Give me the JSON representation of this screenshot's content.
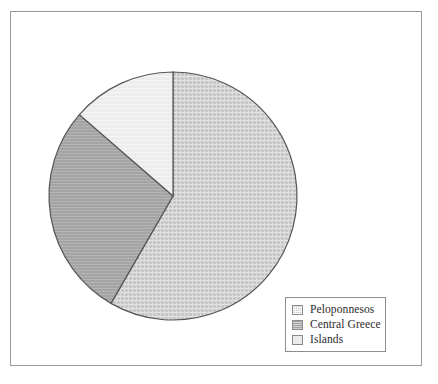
{
  "figure": {
    "background_color": "#ffffff",
    "frame_color": "#9a9a9a"
  },
  "legend": {
    "border_color": "#8d8d8d",
    "entries": [
      {
        "label": "Peloponnesos",
        "color": "#c9c9c9",
        "swatch_name": "legend-swatch-peloponnesos"
      },
      {
        "label": "Central Greece",
        "color": "#a5a5a5",
        "swatch_name": "legend-swatch-central-greece"
      },
      {
        "label": "Islands",
        "color": "#ececec",
        "swatch_name": "legend-swatch-islands"
      }
    ]
  },
  "chart_data": {
    "type": "pie",
    "title": "",
    "subtitle": "",
    "xlabel": "",
    "ylabel": "",
    "grid": false,
    "legend_position": "bottom-right",
    "center_px": [
      173,
      196
    ],
    "radius_px": 124,
    "start_angle_deg": 0,
    "direction": "clockwise",
    "outline_color": "#555555",
    "labels": [
      "Peloponnesos",
      "Central Greece",
      "Islands"
    ],
    "values": [
      58.3,
      28.1,
      13.6
    ],
    "percentages": [
      "58.3%",
      "28.1%",
      "13.6%"
    ],
    "angles_deg": [
      210,
      101,
      49
    ],
    "colors": [
      "#c9c9c9",
      "#a5a5a5",
      "#ececec"
    ],
    "slices": [
      {
        "label": "Peloponnesos",
        "value": 58.3,
        "angle_deg": 210,
        "start_deg": 0,
        "end_deg": 210,
        "color": "#c9c9c9"
      },
      {
        "label": "Central Greece",
        "value": 28.1,
        "angle_deg": 101,
        "start_deg": 210,
        "end_deg": 311,
        "color": "#a5a5a5"
      },
      {
        "label": "Islands",
        "value": 13.6,
        "angle_deg": 49,
        "start_deg": 311,
        "end_deg": 360,
        "color": "#ececec"
      }
    ]
  }
}
